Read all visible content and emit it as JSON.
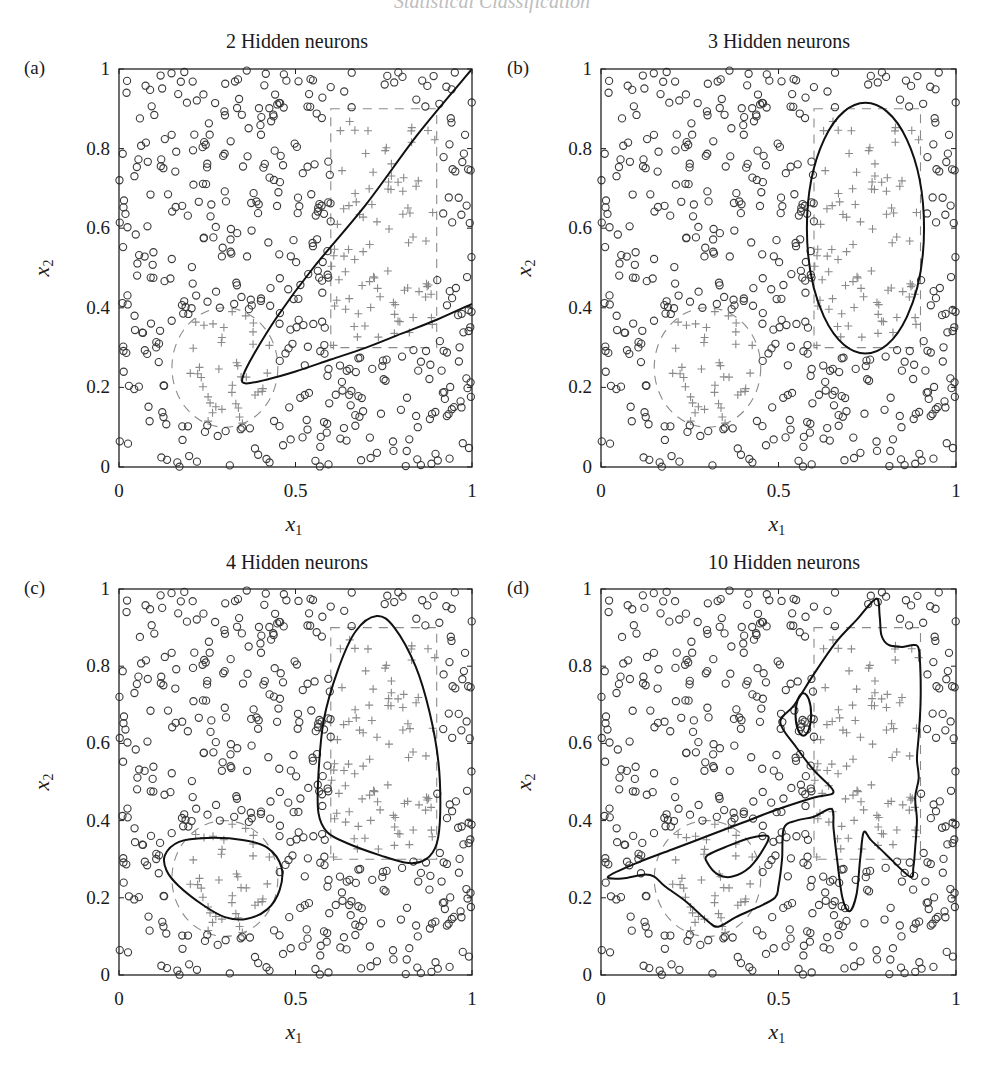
{
  "page": {
    "running_header": "Statistical Classification"
  },
  "style": {
    "circle_color": "#3a3a3a",
    "cross_color": "#8a8a8a",
    "reference_dash_color": "#8a8a8a",
    "boundary_color": "#111111",
    "frame_color": "#222222"
  },
  "panels": [
    {
      "letter": "(a)",
      "title": "2 Hidden neurons",
      "xlabel": "x",
      "xlabel_sub": "1",
      "ylabel": "x",
      "ylabel_sub": "2",
      "xticks": [
        "0",
        "0.5",
        "1"
      ],
      "yticks": [
        "0",
        "0.2",
        "0.4",
        "0.6",
        "0.8",
        "1"
      ]
    },
    {
      "letter": "(b)",
      "title": "3 Hidden neurons",
      "xlabel": "x",
      "xlabel_sub": "1",
      "ylabel": "x",
      "ylabel_sub": "2",
      "xticks": [
        "0",
        "0.5",
        "1"
      ],
      "yticks": [
        "0",
        "0.2",
        "0.4",
        "0.6",
        "0.8",
        "1"
      ]
    },
    {
      "letter": "(c)",
      "title": "4 Hidden neurons",
      "xlabel": "x",
      "xlabel_sub": "1",
      "ylabel": "x",
      "ylabel_sub": "2",
      "xticks": [
        "0",
        "0.5",
        "1"
      ],
      "yticks": [
        "0",
        "0.2",
        "0.4",
        "0.6",
        "0.8",
        "1"
      ]
    },
    {
      "letter": "(d)",
      "title": "10 Hidden neurons",
      "xlabel": "x",
      "xlabel_sub": "1",
      "ylabel": "x",
      "ylabel_sub": "2",
      "xticks": [
        "0",
        "0.5",
        "1"
      ],
      "yticks": [
        "0",
        "0.2",
        "0.4",
        "0.6",
        "0.8",
        "1"
      ]
    }
  ],
  "chart_data": [
    {
      "type": "scatter",
      "title": "2 Hidden neurons",
      "panel": "(a)",
      "xlabel": "x1",
      "ylabel": "x2",
      "xlim": [
        0,
        1
      ],
      "ylim": [
        0,
        1
      ],
      "xticks": [
        0,
        0.5,
        1
      ],
      "yticks": [
        0,
        0.2,
        0.4,
        0.6,
        0.8,
        1
      ],
      "series": [
        {
          "name": "class 0 (circles)",
          "marker": "o"
        },
        {
          "name": "class 1 (crosses)",
          "marker": "+"
        }
      ],
      "reference_regions": [
        {
          "shape": "rectangle",
          "style": "dashed",
          "x": [
            0.6,
            0.9
          ],
          "y": [
            0.3,
            0.9
          ]
        },
        {
          "shape": "circle",
          "style": "dashed",
          "center": [
            0.3,
            0.25
          ],
          "radius": 0.15
        }
      ],
      "decision_boundaries": [
        {
          "style": "solid",
          "points": [
            [
              1.0,
              1.0
            ],
            [
              0.85,
              0.84
            ],
            [
              0.7,
              0.66
            ],
            [
              0.55,
              0.5
            ],
            [
              0.45,
              0.38
            ],
            [
              0.38,
              0.28
            ],
            [
              0.35,
              0.225
            ],
            [
              0.36,
              0.21
            ],
            [
              0.42,
              0.22
            ],
            [
              0.5,
              0.24
            ],
            [
              0.6,
              0.27
            ],
            [
              0.7,
              0.3
            ],
            [
              0.8,
              0.335
            ],
            [
              0.9,
              0.37
            ],
            [
              1.0,
              0.41
            ]
          ]
        }
      ]
    },
    {
      "type": "scatter",
      "title": "3 Hidden neurons",
      "panel": "(b)",
      "xlabel": "x1",
      "ylabel": "x2",
      "xlim": [
        0,
        1
      ],
      "ylim": [
        0,
        1
      ],
      "xticks": [
        0,
        0.5,
        1
      ],
      "yticks": [
        0,
        0.2,
        0.4,
        0.6,
        0.8,
        1
      ],
      "series": [
        {
          "name": "class 0 (circles)",
          "marker": "o"
        },
        {
          "name": "class 1 (crosses)",
          "marker": "+"
        }
      ],
      "reference_regions": [
        {
          "shape": "rectangle",
          "style": "dashed",
          "x": [
            0.6,
            0.9
          ],
          "y": [
            0.3,
            0.9
          ]
        },
        {
          "shape": "circle",
          "style": "dashed",
          "center": [
            0.3,
            0.25
          ],
          "radius": 0.15
        }
      ],
      "decision_boundaries": [
        {
          "style": "solid",
          "shape": "ellipse",
          "center": [
            0.745,
            0.6
          ],
          "rx": 0.165,
          "ry": 0.315
        }
      ]
    },
    {
      "type": "scatter",
      "title": "4 Hidden neurons",
      "panel": "(c)",
      "xlabel": "x1",
      "ylabel": "x2",
      "xlim": [
        0,
        1
      ],
      "ylim": [
        0,
        1
      ],
      "xticks": [
        0,
        0.5,
        1
      ],
      "yticks": [
        0,
        0.2,
        0.4,
        0.6,
        0.8,
        1
      ],
      "series": [
        {
          "name": "class 0 (circles)",
          "marker": "o"
        },
        {
          "name": "class 1 (crosses)",
          "marker": "+"
        }
      ],
      "reference_regions": [
        {
          "shape": "rectangle",
          "style": "dashed",
          "x": [
            0.6,
            0.9
          ],
          "y": [
            0.3,
            0.9
          ]
        },
        {
          "shape": "circle",
          "style": "dashed",
          "center": [
            0.3,
            0.25
          ],
          "radius": 0.15
        }
      ],
      "decision_boundaries": [
        {
          "style": "solid",
          "closed": true,
          "points": [
            [
              0.73,
              0.93
            ],
            [
              0.78,
              0.9
            ],
            [
              0.84,
              0.8
            ],
            [
              0.88,
              0.68
            ],
            [
              0.905,
              0.55
            ],
            [
              0.91,
              0.42
            ],
            [
              0.9,
              0.34
            ],
            [
              0.87,
              0.3
            ],
            [
              0.82,
              0.29
            ],
            [
              0.74,
              0.31
            ],
            [
              0.65,
              0.34
            ],
            [
              0.59,
              0.37
            ],
            [
              0.565,
              0.42
            ],
            [
              0.565,
              0.52
            ],
            [
              0.58,
              0.66
            ],
            [
              0.62,
              0.79
            ],
            [
              0.67,
              0.89
            ]
          ]
        },
        {
          "style": "solid",
          "closed": true,
          "points": [
            [
              0.13,
              0.31
            ],
            [
              0.17,
              0.345
            ],
            [
              0.25,
              0.355
            ],
            [
              0.35,
              0.35
            ],
            [
              0.42,
              0.33
            ],
            [
              0.46,
              0.28
            ],
            [
              0.455,
              0.22
            ],
            [
              0.42,
              0.17
            ],
            [
              0.36,
              0.145
            ],
            [
              0.3,
              0.15
            ],
            [
              0.24,
              0.18
            ],
            [
              0.17,
              0.23
            ],
            [
              0.135,
              0.27
            ]
          ]
        }
      ]
    },
    {
      "type": "scatter",
      "title": "10 Hidden neurons",
      "panel": "(d)",
      "xlabel": "x1",
      "ylabel": "x2",
      "xlim": [
        0,
        1
      ],
      "ylim": [
        0,
        1
      ],
      "xticks": [
        0,
        0.5,
        1
      ],
      "yticks": [
        0,
        0.2,
        0.4,
        0.6,
        0.8,
        1
      ],
      "series": [
        {
          "name": "class 0 (circles)",
          "marker": "o"
        },
        {
          "name": "class 1 (crosses)",
          "marker": "+"
        }
      ],
      "reference_regions": [
        {
          "shape": "rectangle",
          "style": "dashed",
          "x": [
            0.6,
            0.9
          ],
          "y": [
            0.3,
            0.9
          ]
        },
        {
          "shape": "circle",
          "style": "dashed",
          "center": [
            0.3,
            0.25
          ],
          "radius": 0.15
        }
      ],
      "decision_boundaries": [
        {
          "style": "solid",
          "closed": true,
          "points": [
            [
              0.02,
              0.255
            ],
            [
              0.1,
              0.29
            ],
            [
              0.2,
              0.325
            ],
            [
              0.3,
              0.36
            ],
            [
              0.4,
              0.395
            ],
            [
              0.5,
              0.43
            ],
            [
              0.6,
              0.46
            ],
            [
              0.655,
              0.475
            ],
            [
              0.6,
              0.53
            ],
            [
              0.55,
              0.59
            ],
            [
              0.505,
              0.655
            ],
            [
              0.545,
              0.7
            ],
            [
              0.6,
              0.78
            ],
            [
              0.66,
              0.86
            ],
            [
              0.72,
              0.92
            ],
            [
              0.775,
              0.975
            ],
            [
              0.785,
              0.93
            ],
            [
              0.79,
              0.88
            ],
            [
              0.81,
              0.855
            ],
            [
              0.85,
              0.85
            ],
            [
              0.88,
              0.855
            ],
            [
              0.895,
              0.845
            ],
            [
              0.9,
              0.78
            ],
            [
              0.9,
              0.7
            ],
            [
              0.895,
              0.62
            ],
            [
              0.89,
              0.56
            ],
            [
              0.895,
              0.51
            ],
            [
              0.885,
              0.46
            ],
            [
              0.89,
              0.4
            ],
            [
              0.885,
              0.33
            ],
            [
              0.88,
              0.28
            ],
            [
              0.87,
              0.255
            ],
            [
              0.8,
              0.315
            ],
            [
              0.76,
              0.35
            ],
            [
              0.74,
              0.37
            ],
            [
              0.73,
              0.3
            ],
            [
              0.72,
              0.21
            ],
            [
              0.7,
              0.165
            ],
            [
              0.68,
              0.2
            ],
            [
              0.665,
              0.3
            ],
            [
              0.655,
              0.38
            ],
            [
              0.65,
              0.43
            ],
            [
              0.6,
              0.41
            ],
            [
              0.55,
              0.4
            ],
            [
              0.515,
              0.38
            ],
            [
              0.51,
              0.3
            ],
            [
              0.5,
              0.23
            ],
            [
              0.49,
              0.2
            ],
            [
              0.44,
              0.175
            ],
            [
              0.38,
              0.15
            ],
            [
              0.33,
              0.125
            ],
            [
              0.3,
              0.14
            ],
            [
              0.24,
              0.19
            ],
            [
              0.18,
              0.23
            ],
            [
              0.15,
              0.255
            ],
            [
              0.12,
              0.26
            ],
            [
              0.06,
              0.25
            ]
          ]
        },
        {
          "style": "solid",
          "closed": true,
          "points": [
            [
              0.3,
              0.31
            ],
            [
              0.36,
              0.335
            ],
            [
              0.42,
              0.355
            ],
            [
              0.47,
              0.36
            ],
            [
              0.46,
              0.33
            ],
            [
              0.42,
              0.28
            ],
            [
              0.37,
              0.255
            ],
            [
              0.33,
              0.26
            ],
            [
              0.3,
              0.29
            ]
          ]
        },
        {
          "style": "solid",
          "shape": "ellipse",
          "center": [
            0.57,
            0.675
          ],
          "rx": 0.022,
          "ry": 0.055
        }
      ]
    }
  ]
}
